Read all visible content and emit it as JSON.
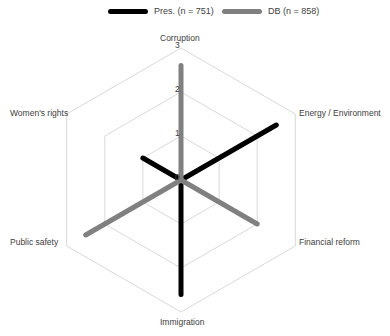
{
  "chart_data": {
    "type": "radar",
    "title": "",
    "categories": [
      "Corruption",
      "Energy / Environment",
      "Financial reform",
      "Immigration",
      "Public safety",
      "Women's rights"
    ],
    "series": [
      {
        "name": "Pres. (n = 751)",
        "color": "#000000",
        "values": [
          0,
          2.5,
          0,
          2.6,
          0,
          1.0
        ]
      },
      {
        "name": "DB (n = 858)",
        "color": "#808080",
        "values": [
          2.6,
          0,
          2.0,
          0,
          2.5,
          0
        ]
      }
    ],
    "radial_ticks": [
      "0",
      "1",
      "2",
      "3"
    ],
    "rlim": [
      0,
      3
    ],
    "grid": true,
    "legend_position": "top"
  },
  "legend": {
    "items": [
      {
        "label": "Pres. (n = 751)",
        "color": "#000000"
      },
      {
        "label": "DB (n = 858)",
        "color": "#808080"
      }
    ]
  },
  "axes": {
    "labels": [
      "Corruption",
      "Energy / Environment",
      "Financial reform",
      "Immigration",
      "Public safety",
      "Women's rights"
    ],
    "ticks": [
      "0",
      "1",
      "2",
      "3"
    ]
  }
}
